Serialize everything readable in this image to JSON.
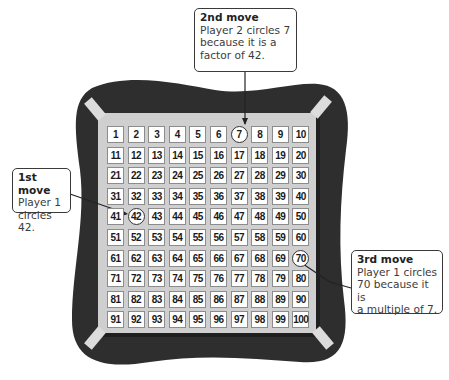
{
  "colors": {
    "board_dark": "#2e2e2e",
    "board_face": "#cfcfcf",
    "tape": "#d9d9d9",
    "cell_bg": "#ffffff",
    "cell_border": "#8c8c8c",
    "callout_border": "#3a3a3a"
  },
  "grid": {
    "rows": 10,
    "cols": 10,
    "numbers": [
      1,
      2,
      3,
      4,
      5,
      6,
      7,
      8,
      9,
      10,
      11,
      12,
      13,
      14,
      15,
      16,
      17,
      18,
      19,
      20,
      21,
      22,
      23,
      24,
      25,
      26,
      27,
      28,
      29,
      30,
      31,
      32,
      33,
      34,
      35,
      36,
      37,
      38,
      39,
      40,
      41,
      42,
      43,
      44,
      45,
      46,
      47,
      48,
      49,
      50,
      51,
      52,
      53,
      54,
      55,
      56,
      57,
      58,
      59,
      60,
      61,
      62,
      63,
      64,
      65,
      66,
      67,
      68,
      69,
      70,
      71,
      72,
      73,
      74,
      75,
      76,
      77,
      78,
      79,
      80,
      81,
      82,
      83,
      84,
      85,
      86,
      87,
      88,
      89,
      90,
      91,
      92,
      93,
      94,
      95,
      96,
      97,
      98,
      99,
      100
    ],
    "circled": [
      7,
      42,
      70
    ]
  },
  "callouts": {
    "first": {
      "title": "1st move",
      "body": "Player 1\ncircles 42."
    },
    "second": {
      "title": "2nd move",
      "body": "Player 2 circles 7\nbecause it is a\nfactor of 42."
    },
    "third": {
      "title": "3rd move",
      "body": "Player 1 circles\n70 because it is\na multiple of 7."
    }
  }
}
